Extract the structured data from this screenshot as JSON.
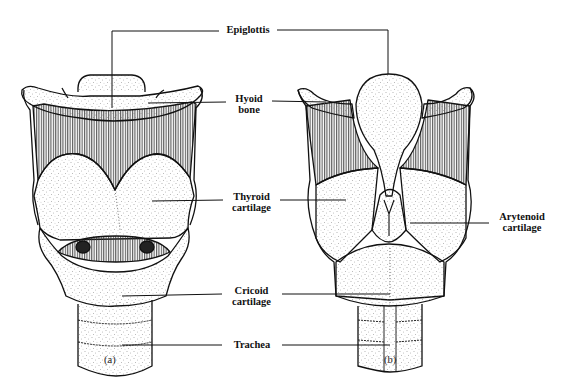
{
  "figure": {
    "panels": [
      {
        "id": "a",
        "caption": "(a)"
      },
      {
        "id": "b",
        "caption": "(b)"
      }
    ],
    "labels": {
      "epiglottis": {
        "line1": "Epiglottis"
      },
      "hyoid": {
        "line1": "Hyoid",
        "line2": "bone"
      },
      "thyroid": {
        "line1": "Thyroid",
        "line2": "cartilage"
      },
      "arytenoid": {
        "line1": "Arytenoid",
        "line2": "cartilage"
      },
      "cricoid": {
        "line1": "Cricoid",
        "line2": "cartilage"
      },
      "trachea": {
        "line1": "Trachea"
      }
    },
    "colors": {
      "ink": "#111111",
      "paper": "#ffffff",
      "stipple": "#555555",
      "hatch": "#333333"
    }
  }
}
